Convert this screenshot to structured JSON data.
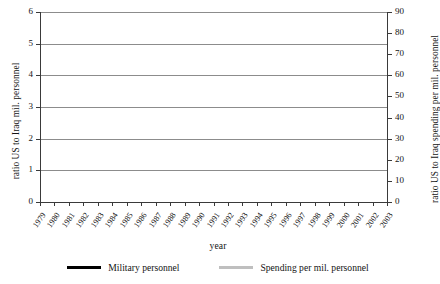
{
  "chart_data": {
    "type": "line",
    "title": "",
    "xlabel": "year",
    "ylabel": "ratio US to Iraq mil. personnel",
    "y2label": "ratio US to Iraq spending per mil. personnel",
    "grid": true,
    "legend_position": "bottom",
    "xlim": [
      1979,
      2003
    ],
    "ylim": [
      0,
      6
    ],
    "y2lim": [
      0,
      90
    ],
    "yticks": [
      0,
      1,
      2,
      3,
      4,
      5,
      6
    ],
    "y2ticks": [
      0,
      10,
      20,
      30,
      40,
      50,
      60,
      70,
      80,
      90
    ],
    "categories": [
      "1979",
      "1980",
      "1981",
      "1982",
      "1983",
      "1984",
      "1985",
      "1986",
      "1987",
      "1988",
      "1989",
      "1990",
      "1991",
      "1992",
      "1993",
      "1994",
      "1995",
      "1996",
      "1997",
      "1998",
      "1999",
      "2000",
      "2001",
      "2002",
      "2003"
    ],
    "series": [
      {
        "name": "Military personnel",
        "axis": "left",
        "color": "#000000",
        "values": [
          4.55,
          4.75,
          5.15,
          5.35,
          5.35,
          5.3,
          5.05,
          2.85,
          2.85,
          2.8,
          2.8,
          2.45,
          2.2,
          2.2,
          1.6,
          4.5,
          4.75,
          4.55,
          4.1,
          3.55,
          3.35,
          3.5,
          3.45,
          3.4,
          3.15
        ]
      },
      {
        "name": "Spending per mil. personnel",
        "axis": "right",
        "color": "#bfbfbf",
        "values": [
          10.0,
          10.2,
          9.6,
          5.2,
          5.4,
          5.6,
          4.4,
          5.6,
          6.6,
          7.2,
          7.6,
          7.8,
          8.2,
          9.2,
          11.6,
          21.0,
          5.0,
          27.0,
          28.2,
          30.0,
          30.2,
          62.0,
          61.8,
          61.6,
          56.4
        ]
      }
    ],
    "series_note_left_extended": [
      3.15,
      3.6
    ]
  },
  "legend": {
    "items": [
      {
        "label": "Military personnel",
        "color": "#000000"
      },
      {
        "label": "Spending per mil. personnel",
        "color": "#bfbfbf"
      }
    ]
  },
  "axes": {
    "x_label": "year",
    "y_left_label": "ratio US to Iraq mil. personnel",
    "y_right_label": "ratio US to Iraq spending per mil. personnel"
  },
  "series_full": {
    "military_personnel": {
      "1979": 4.55,
      "1980": 4.75,
      "1981": 5.15,
      "1982": 5.35,
      "1983": 5.35,
      "1984": 5.3,
      "1985": 5.05,
      "1986": 2.85,
      "1987": 2.85,
      "1988": 2.8,
      "1989": 2.55,
      "1990": 2.2,
      "1991": 2.2,
      "1992": 1.6,
      "1993": 4.5,
      "1994": 4.75,
      "1995": 4.55,
      "1996": 4.1,
      "1997": 3.55,
      "1998": 3.35,
      "1999": 3.5,
      "2000": 3.45,
      "2001": 3.4,
      "2002": 3.15,
      "2003": 3.6
    },
    "spending_per_mil_personnel": {
      "1979": 10.0,
      "1980": 10.2,
      "1981": 9.6,
      "1982": 5.2,
      "1983": 5.4,
      "1984": 5.6,
      "1985": 4.4,
      "1986": 5.6,
      "1987": 6.6,
      "1988": 7.2,
      "1989": 7.6,
      "1990": 7.8,
      "1991": 8.2,
      "1992": 9.2,
      "1993": 11.6,
      "1994": 21.0,
      "1995": 5.0,
      "1996": 27.0,
      "1997": 28.2,
      "1998": 30.0,
      "1999": 30.2,
      "2000": 62.0,
      "2001": 61.8,
      "2002": 61.6,
      "2003": 56.4
    }
  }
}
